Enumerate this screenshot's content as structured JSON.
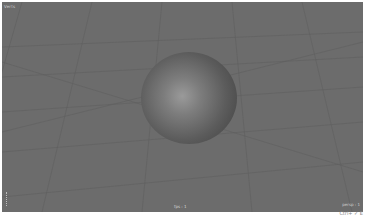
{
  "viewport": {
    "background": "#6c6c6c",
    "hud_top_left": "Verts",
    "hud_bottom_center": "fps : 1",
    "hud_bottom_right": "persp : 1",
    "object": "sphere"
  },
  "footer": {
    "note": "Ctrl+ ✓ E"
  }
}
